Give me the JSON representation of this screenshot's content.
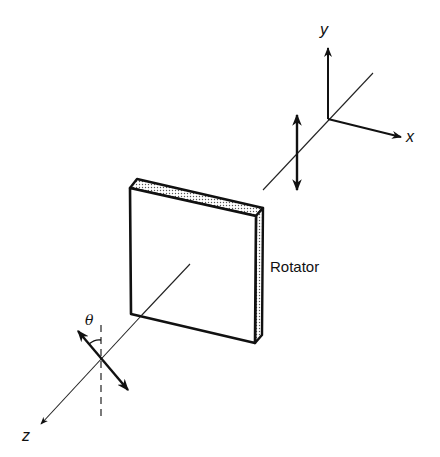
{
  "diagram": {
    "colors": {
      "background": "#ffffff",
      "ink": "#111111",
      "stipple": "#555555"
    },
    "axes": {
      "x_label": "x",
      "y_label": "y",
      "z_label": "z"
    },
    "components": {
      "rotator_label": "Rotator"
    },
    "annotations": {
      "angle_label": "θ"
    },
    "arrows": {
      "input_polarization": "vertical double arrow (along y)",
      "output_polarization": "tilted double arrow rotated by θ from vertical"
    }
  }
}
